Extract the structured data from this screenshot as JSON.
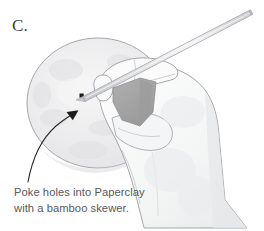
{
  "figure": {
    "step_label": "C.",
    "caption_line_1": "Poke holes into Paperclay",
    "caption_line_2": "with a bamboo skewer.",
    "caption_full": "Poke holes into Paperclay with a bamboo skewer.",
    "illustration_alt": "A hand holding a bamboo skewer poking holes into a round slab of Paperclay"
  },
  "annotation": {
    "leader_arrow_target": "poked-holes",
    "hole_count": 2
  },
  "colors": {
    "background": "#ffffff",
    "caption_text": "#59595b",
    "step_label_text": "#3d3d3d",
    "outline": "#8a8d91",
    "clay_disc_fill": "#efeff0",
    "clay_disc_shade": "#e4e4e6",
    "clay_wedge_fill": "#a6a6a6",
    "hand_fill": "#fafafa",
    "hand_shade": "#e8e9ea",
    "skewer_fill": "#dcdcde",
    "skewer_highlight": "#f4f4f5",
    "leader_line": "#262626",
    "hole_fill": "#1a1a1a"
  },
  "icons": {
    "skewer": "bamboo-skewer-icon",
    "clay": "clay-disc-icon",
    "hand": "hand-icon",
    "arrow": "leader-arrow-icon"
  }
}
